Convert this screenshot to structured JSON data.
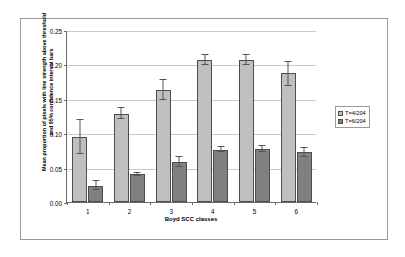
{
  "chart_data": {
    "type": "bar",
    "title": "",
    "xlabel": "Boyd SCC classes",
    "ylabel": "Mean proportion of pixels with line strength above threshold and 95% confidence interval bars",
    "categories": [
      "1",
      "2",
      "3",
      "4",
      "5",
      "6"
    ],
    "ylim": [
      0.0,
      0.25
    ],
    "yticks": [
      "0.00",
      "0.05",
      "0.10",
      "0.15",
      "0.20",
      "0.25"
    ],
    "ytick_values": [
      0.0,
      0.05,
      0.1,
      0.15,
      0.2,
      0.25
    ],
    "grid": true,
    "legend_position": "right",
    "series": [
      {
        "name": "T=4/204",
        "color": "#bfbfbf",
        "values": [
          0.094,
          0.128,
          0.163,
          0.206,
          0.206,
          0.187
        ],
        "err_low": [
          0.07,
          0.12,
          0.148,
          0.199,
          0.199,
          0.168
        ],
        "err_high": [
          0.119,
          0.136,
          0.177,
          0.214,
          0.214,
          0.204
        ]
      },
      {
        "name": "T=6/204",
        "color": "#808080",
        "values": [
          0.024,
          0.04,
          0.058,
          0.076,
          0.077,
          0.072
        ],
        "err_low": [
          0.017,
          0.038,
          0.051,
          0.072,
          0.073,
          0.065
        ],
        "err_high": [
          0.031,
          0.042,
          0.065,
          0.08,
          0.081,
          0.079
        ]
      }
    ]
  },
  "legend": {
    "items": [
      {
        "label": "T=4/204"
      },
      {
        "label": "T=6/204"
      }
    ]
  }
}
